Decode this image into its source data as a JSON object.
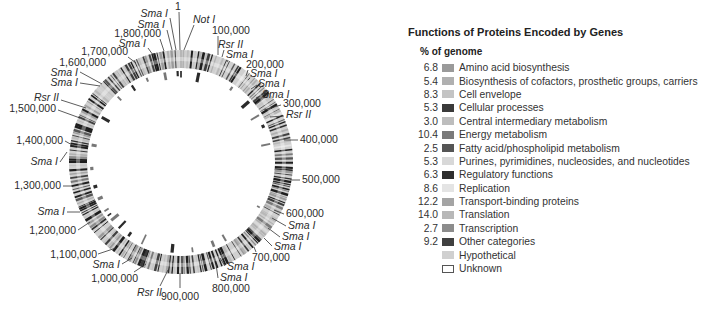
{
  "map": {
    "center": [
      181,
      162
    ],
    "outer_radius": 112,
    "inner_radius": 94,
    "labels": [
      {
        "text": "1",
        "x": 178,
        "y": 10,
        "italic": false,
        "anchor": "middle",
        "lx1": 179,
        "ly1": 12,
        "lx2": 180,
        "ly2": 50
      },
      {
        "text": "Sma I",
        "x": 168,
        "y": 17,
        "italic": true,
        "anchor": "end",
        "lx1": 170,
        "ly1": 18,
        "lx2": 176,
        "ly2": 50
      },
      {
        "text": "Not I",
        "x": 193,
        "y": 23,
        "italic": true,
        "anchor": "start",
        "lx1": 194,
        "ly1": 25,
        "lx2": 184,
        "ly2": 50
      },
      {
        "text": "Sma I",
        "x": 165,
        "y": 28,
        "italic": true,
        "anchor": "end",
        "lx1": 167,
        "ly1": 30,
        "lx2": 172,
        "ly2": 50
      },
      {
        "text": "1,800,000",
        "x": 161,
        "y": 37,
        "italic": false,
        "anchor": "end",
        "lx1": 160,
        "ly1": 39,
        "lx2": 164,
        "ly2": 51
      },
      {
        "text": "100,000",
        "x": 212,
        "y": 34,
        "italic": false,
        "anchor": "start",
        "lx1": 218,
        "ly1": 36,
        "lx2": 218,
        "ly2": 55
      },
      {
        "text": "Sma I",
        "x": 146,
        "y": 47,
        "italic": true,
        "anchor": "end",
        "lx1": 148,
        "ly1": 48,
        "lx2": 153,
        "ly2": 55
      },
      {
        "text": "Rsr II",
        "x": 218,
        "y": 48,
        "italic": true,
        "anchor": "start",
        "lx1": 224,
        "ly1": 50,
        "lx2": 222,
        "ly2": 57
      },
      {
        "text": "1,700,000",
        "x": 128,
        "y": 55,
        "italic": false,
        "anchor": "end",
        "lx1": 128,
        "ly1": 57,
        "lx2": 136,
        "ly2": 63
      },
      {
        "text": "Sma I",
        "x": 226,
        "y": 58,
        "italic": true,
        "anchor": "start",
        "lx1": 228,
        "ly1": 60,
        "lx2": 227,
        "ly2": 62
      },
      {
        "text": "1,600,000",
        "x": 106,
        "y": 66,
        "italic": false,
        "anchor": "end",
        "lx1": 0,
        "ly1": 0,
        "lx2": 0,
        "ly2": 0
      },
      {
        "text": "200,000",
        "x": 246,
        "y": 68,
        "italic": false,
        "anchor": "start",
        "lx1": 248,
        "ly1": 70,
        "lx2": 246,
        "ly2": 76
      },
      {
        "text": "Sma I",
        "x": 250,
        "y": 77,
        "italic": true,
        "anchor": "start",
        "lx1": 250,
        "ly1": 78,
        "lx2": 248,
        "ly2": 80
      },
      {
        "text": "Sma I",
        "x": 78,
        "y": 76,
        "italic": true,
        "anchor": "end",
        "lx1": 80,
        "ly1": 72,
        "lx2": 102,
        "ly2": 84
      },
      {
        "text": "Sma I",
        "x": 78,
        "y": 86,
        "italic": true,
        "anchor": "end",
        "lx1": 80,
        "ly1": 83,
        "lx2": 100,
        "ly2": 86
      },
      {
        "text": "Sma I",
        "x": 258,
        "y": 87,
        "italic": true,
        "anchor": "start",
        "lx1": 257,
        "ly1": 85,
        "lx2": 251,
        "ly2": 89
      },
      {
        "text": "Sma I",
        "x": 262,
        "y": 98,
        "italic": true,
        "anchor": "start",
        "lx1": 260,
        "ly1": 96,
        "lx2": 256,
        "ly2": 98
      },
      {
        "text": "Rsr II",
        "x": 59,
        "y": 101,
        "italic": true,
        "anchor": "end",
        "lx1": 61,
        "ly1": 100,
        "lx2": 86,
        "ly2": 108
      },
      {
        "text": "300,000",
        "x": 283,
        "y": 107,
        "italic": false,
        "anchor": "start",
        "lx1": 281,
        "ly1": 105,
        "lx2": 264,
        "ly2": 110
      },
      {
        "text": "1,500,000",
        "x": 56,
        "y": 112,
        "italic": false,
        "anchor": "end",
        "lx1": 58,
        "ly1": 110,
        "lx2": 80,
        "ly2": 118
      },
      {
        "text": "Rsr II",
        "x": 286,
        "y": 118,
        "italic": true,
        "anchor": "start",
        "lx1": 284,
        "ly1": 116,
        "lx2": 270,
        "ly2": 117
      },
      {
        "text": "400,000",
        "x": 300,
        "y": 143,
        "italic": false,
        "anchor": "start",
        "lx1": 298,
        "ly1": 140,
        "lx2": 284,
        "ly2": 140
      },
      {
        "text": "1,400,000",
        "x": 63,
        "y": 144,
        "italic": false,
        "anchor": "end",
        "lx1": 65,
        "ly1": 141,
        "lx2": 74,
        "ly2": 146
      },
      {
        "text": "Sma I",
        "x": 58,
        "y": 165,
        "italic": true,
        "anchor": "end",
        "lx1": 60,
        "ly1": 162,
        "lx2": 67,
        "ly2": 152
      },
      {
        "text": "1,300,000",
        "x": 61,
        "y": 189,
        "italic": false,
        "anchor": "end",
        "lx1": 63,
        "ly1": 186,
        "lx2": 73,
        "ly2": 186
      },
      {
        "text": "500,000",
        "x": 302,
        "y": 183,
        "italic": false,
        "anchor": "start",
        "lx1": 300,
        "ly1": 180,
        "lx2": 290,
        "ly2": 180
      },
      {
        "text": "Sma I",
        "x": 65,
        "y": 215,
        "italic": true,
        "anchor": "end",
        "lx1": 67,
        "ly1": 212,
        "lx2": 80,
        "ly2": 212
      },
      {
        "text": "600,000",
        "x": 286,
        "y": 217,
        "italic": false,
        "anchor": "start",
        "lx1": 284,
        "ly1": 214,
        "lx2": 274,
        "ly2": 210
      },
      {
        "text": "Sma I",
        "x": 288,
        "y": 229,
        "italic": true,
        "anchor": "start",
        "lx1": 286,
        "ly1": 226,
        "lx2": 272,
        "ly2": 218
      },
      {
        "text": "1,200,000",
        "x": 76,
        "y": 234,
        "italic": false,
        "anchor": "end",
        "lx1": 78,
        "ly1": 230,
        "lx2": 90,
        "ly2": 222
      },
      {
        "text": "Sma I",
        "x": 282,
        "y": 240,
        "italic": true,
        "anchor": "start",
        "lx1": 280,
        "ly1": 237,
        "lx2": 268,
        "ly2": 228
      },
      {
        "text": "Sma I",
        "x": 274,
        "y": 250,
        "italic": true,
        "anchor": "start",
        "lx1": 272,
        "ly1": 246,
        "lx2": 264,
        "ly2": 238
      },
      {
        "text": "700,000",
        "x": 252,
        "y": 261,
        "italic": false,
        "anchor": "start",
        "lx1": 256,
        "ly1": 252,
        "lx2": 254,
        "ly2": 247
      },
      {
        "text": "1,100,000",
        "x": 97,
        "y": 258,
        "italic": false,
        "anchor": "end",
        "lx1": 98,
        "ly1": 254,
        "lx2": 116,
        "ly2": 248
      },
      {
        "text": "Sma I",
        "x": 227,
        "y": 270,
        "italic": true,
        "anchor": "start",
        "lx1": 225,
        "ly1": 266,
        "lx2": 220,
        "ly2": 258
      },
      {
        "text": "Sma I",
        "x": 120,
        "y": 268,
        "italic": true,
        "anchor": "end",
        "lx1": 122,
        "ly1": 264,
        "lx2": 132,
        "ly2": 258
      },
      {
        "text": "Sma I",
        "x": 220,
        "y": 281,
        "italic": true,
        "anchor": "start",
        "lx1": 218,
        "ly1": 278,
        "lx2": 216,
        "ly2": 264
      },
      {
        "text": "800,000",
        "x": 212,
        "y": 292,
        "italic": false,
        "anchor": "start",
        "lx1": 0,
        "ly1": 0,
        "lx2": 0,
        "ly2": 0
      },
      {
        "text": "1,000,000",
        "x": 138,
        "y": 282,
        "italic": false,
        "anchor": "end",
        "lx1": 134,
        "ly1": 272,
        "lx2": 146,
        "ly2": 264
      },
      {
        "text": "Rsr II",
        "x": 162,
        "y": 296,
        "italic": true,
        "anchor": "end",
        "lx1": 160,
        "ly1": 286,
        "lx2": 168,
        "ly2": 270
      },
      {
        "text": "900,000",
        "x": 180,
        "y": 300,
        "italic": false,
        "anchor": "middle",
        "lx1": 180,
        "ly1": 288,
        "lx2": 180,
        "ly2": 273
      }
    ]
  },
  "legend": {
    "title": "Functions of Proteins Encoded by Genes",
    "subtitle": "% of genome",
    "items": [
      {
        "pct": "6.8",
        "label": "Amino acid biosynthesis",
        "color": "#9a9a9a"
      },
      {
        "pct": "5.4",
        "label": "Biosynthesis of cofactors, prosthetic groups, carriers",
        "color": "#b0b0b0"
      },
      {
        "pct": "8.3",
        "label": "Cell envelope",
        "color": "#c4c4c4"
      },
      {
        "pct": "5.3",
        "label": "Cellular processes",
        "color": "#3a3a3a"
      },
      {
        "pct": "3.0",
        "label": "Central intermediary metabolism",
        "color": "#bdbdbd"
      },
      {
        "pct": "10.4",
        "label": "Energy metabolism",
        "color": "#7a7a7a"
      },
      {
        "pct": "2.5",
        "label": "Fatty acid/phospholipid metabolism",
        "color": "#555555"
      },
      {
        "pct": "5.3",
        "label": "Purines, pyrimidines, nucleosides, and nucleotides",
        "color": "#d8d8d8"
      },
      {
        "pct": "6.3",
        "label": "Regulatory functions",
        "color": "#2e2e2e"
      },
      {
        "pct": "8.6",
        "label": "Replication",
        "color": "#e4e4e4"
      },
      {
        "pct": "12.2",
        "label": "Transport-binding proteins",
        "color": "#a4a4a4"
      },
      {
        "pct": "14.0",
        "label": "Translation",
        "color": "#b8b8b8"
      },
      {
        "pct": "2.7",
        "label": "Transcription",
        "color": "#8c8c8c"
      },
      {
        "pct": "9.2",
        "label": "Other categories",
        "color": "#404040"
      },
      {
        "pct": "",
        "label": "Hypothetical",
        "color": "#d0d0d0"
      },
      {
        "pct": "",
        "label": "Unknown",
        "color": "#ffffff"
      }
    ]
  }
}
